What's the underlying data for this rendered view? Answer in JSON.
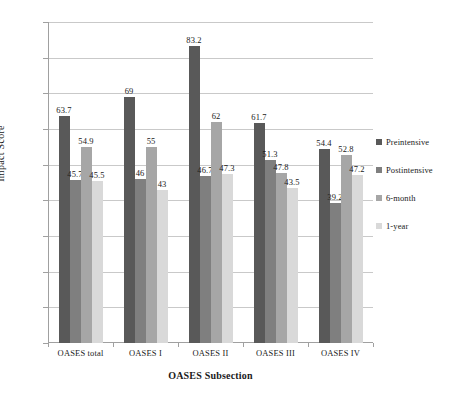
{
  "chart_data": {
    "type": "bar",
    "title": "",
    "xlabel": "OASES Subsection",
    "ylabel": "Impact Score",
    "ylim": [
      0,
      90
    ],
    "ytick_step": 10,
    "yticks": [
      0,
      10,
      20,
      30,
      40,
      50,
      60,
      70,
      80,
      90
    ],
    "grid": true,
    "legend_position": "right",
    "categories": [
      "OASES total",
      "OASES I",
      "OASES II",
      "OASES III",
      "OASES IV"
    ],
    "series": [
      {
        "name": "Preintensive",
        "color": "#595959",
        "values": [
          63.7,
          69,
          83.2,
          61.7,
          54.4
        ],
        "labels": [
          "63.7",
          "69",
          "83.2",
          "61.7",
          "54.4"
        ]
      },
      {
        "name": "Postintensive",
        "color": "#7f7f7f",
        "values": [
          45.7,
          46,
          46.7,
          51.3,
          39.2
        ],
        "labels": [
          "45.7",
          "46",
          "46.7",
          "51.3",
          "39.2"
        ]
      },
      {
        "name": "6-month",
        "color": "#a6a6a6",
        "values": [
          54.9,
          55,
          62,
          47.8,
          52.8
        ],
        "labels": [
          "54.9",
          "55",
          "62",
          "47.8",
          "52.8"
        ]
      },
      {
        "name": "1-year",
        "color": "#d9d9d9",
        "values": [
          45.5,
          43,
          47.3,
          43.5,
          47.2
        ],
        "labels": [
          "45.5",
          "43",
          "47.3",
          "43.5",
          "47.2"
        ]
      }
    ]
  },
  "axis": {
    "y_title": "Impact Score",
    "x_title": "OASES Subsection"
  }
}
